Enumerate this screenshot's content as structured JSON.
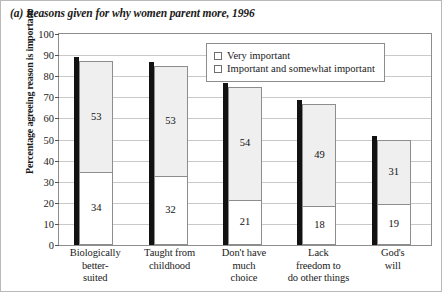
{
  "caption": "(a) Reasons given for why women parent more, 1996",
  "legend": {
    "position": "top-center-inside",
    "items": [
      {
        "label": "Very important",
        "swatch": "white-outline"
      },
      {
        "label": "Important and somewhat important",
        "swatch": "light-gray-outline"
      }
    ]
  },
  "colors": {
    "very_important": "#ffffff",
    "important_and_somewhat": "#efefef",
    "bar_outline": "#8d8d8d",
    "bar_shadow": "#121212",
    "gridline": "#c9c9c9",
    "frame": "#b9b9b9"
  },
  "chart_data": {
    "type": "bar",
    "title": "(a) Reasons given for why women parent more, 1996",
    "xlabel": "",
    "ylabel": "Percentage agreeing reason is important",
    "ylim": [
      0,
      100
    ],
    "yticks": [
      0,
      10,
      20,
      30,
      40,
      50,
      60,
      70,
      80,
      90,
      100
    ],
    "ytick_labels": [
      "0",
      "10",
      "20",
      "30",
      "40",
      "50",
      "60",
      "70",
      "80",
      "90",
      "100"
    ],
    "grid": true,
    "stacked": true,
    "legend_position": "upper center",
    "categories": [
      "Biologically better-suited",
      "Taught from childhood",
      "Don't have much choice",
      "Lack freedom to do other things",
      "God's will"
    ],
    "category_lines": [
      [
        "Biologically",
        "better-",
        "suited"
      ],
      [
        "Taught from",
        "childhood"
      ],
      [
        "Don't have",
        "much",
        "choice"
      ],
      [
        "Lack",
        "freedom to",
        "do other things"
      ],
      [
        "God's",
        "will"
      ]
    ],
    "series": [
      {
        "name": "Very important",
        "values": [
          34,
          32,
          21,
          18,
          19
        ]
      },
      {
        "name": "Important and somewhat important",
        "values": [
          53,
          53,
          54,
          49,
          31
        ]
      }
    ],
    "totals": [
      87,
      85,
      75,
      67,
      50
    ]
  }
}
